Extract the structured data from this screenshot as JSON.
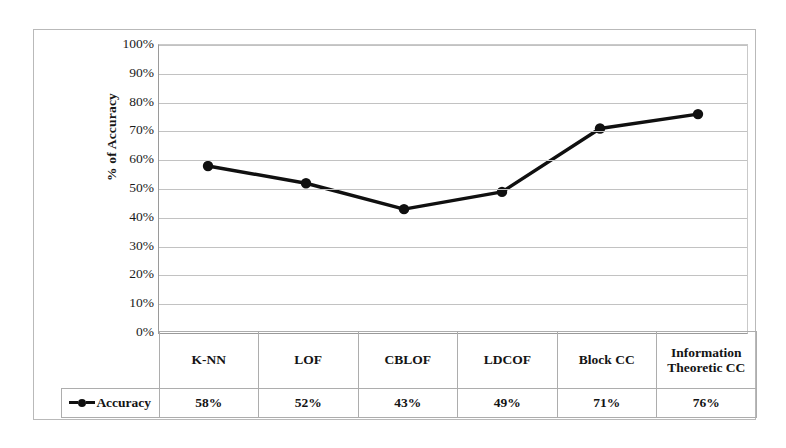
{
  "chart_data": {
    "type": "line",
    "title": "",
    "xlabel": "",
    "ylabel": "% of Accuracy",
    "ylim": [
      0,
      100
    ],
    "grid": true,
    "legend_position": "bottom-left-table-cell",
    "categories": [
      "K-NN",
      "LOF",
      "CBLOF",
      "LDCOF",
      "Block CC",
      "Information Theoretic CC"
    ],
    "series": [
      {
        "name": "Accuracy",
        "values": [
          58,
          52,
          43,
          49,
          71,
          76
        ],
        "value_labels": [
          "58%",
          "52%",
          "43%",
          "49%",
          "71%",
          "76%"
        ],
        "color": "#101010",
        "marker": "filled-circle"
      }
    ],
    "y_ticks": [
      0,
      10,
      20,
      30,
      40,
      50,
      60,
      70,
      80,
      90,
      100
    ],
    "y_tick_labels": [
      "0%",
      "10%",
      "20%",
      "30%",
      "40%",
      "50%",
      "60%",
      "70%",
      "80%",
      "90%",
      "100%"
    ]
  },
  "axis": {
    "y_title": "% of Accuracy",
    "ticks": [
      "100%",
      "90%",
      "80%",
      "70%",
      "60%",
      "50%",
      "40%",
      "30%",
      "20%",
      "10%",
      "0%"
    ]
  },
  "table": {
    "legend_label": "Accuracy",
    "headers": [
      "K-NN",
      "LOF",
      "CBLOF",
      "LDCOF",
      "Block CC",
      "Information Theoretic CC"
    ],
    "values": [
      "58%",
      "52%",
      "43%",
      "49%",
      "71%",
      "76%"
    ]
  },
  "colors": {
    "series": "#101010",
    "gridline": "#c2c2c2",
    "border": "#adadad",
    "background": "#ffffff"
  }
}
